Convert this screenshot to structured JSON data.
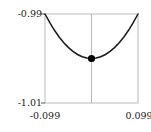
{
  "figure": {
    "background_color": "#ffffff",
    "frame_color": "#b9b9b9",
    "curve_color": "#1a1a1a",
    "marker_color": "#000000",
    "axis_line_color": "#808080",
    "label_color": "#1a1a1a"
  },
  "axes": {
    "y_top_label": "-0.99",
    "y_bottom_label": "-1.01",
    "x_left_label": "-0.099",
    "x_right_label": "0.099"
  },
  "chart_data": {
    "type": "line",
    "title": "",
    "xlabel": "",
    "ylabel": "",
    "xlim": [
      -0.099,
      0.099
    ],
    "ylim": [
      -1.01,
      -0.99
    ],
    "xticks": [
      -0.099,
      0.099
    ],
    "xticklabels": [
      "-0.099",
      "0.099"
    ],
    "yticks": [
      -1.01,
      -0.99
    ],
    "yticklabels": [
      "-1.01",
      "-0.99"
    ],
    "grid": false,
    "legend": null,
    "vertical_reference_line_x": 0,
    "series": [
      {
        "name": "parabola",
        "type": "line",
        "color": "#1a1a1a",
        "x": [
          -0.099,
          -0.0891,
          -0.0792,
          -0.0693,
          -0.0594,
          -0.0495,
          -0.0396,
          -0.0297,
          -0.0198,
          -0.0099,
          0,
          0.0099,
          0.0198,
          0.0297,
          0.0396,
          0.0495,
          0.0594,
          0.0693,
          0.0792,
          0.0891,
          0.099
        ],
        "y": [
          -0.99,
          -0.9919,
          -0.9936,
          -0.9951,
          -0.9964,
          -0.9975,
          -0.9984,
          -0.9991,
          -0.9996,
          -0.9999,
          -1.0,
          -0.9999,
          -0.9996,
          -0.9991,
          -0.9984,
          -0.9975,
          -0.9964,
          -0.9951,
          -0.9936,
          -0.9919,
          -0.99
        ]
      },
      {
        "name": "minimum-point",
        "type": "scatter",
        "color": "#000000",
        "x": [
          0
        ],
        "y": [
          -1.0
        ]
      }
    ]
  }
}
